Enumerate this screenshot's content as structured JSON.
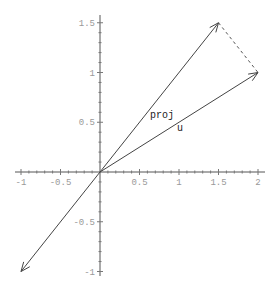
{
  "chart_data": {
    "type": "line",
    "title": "",
    "xlabel": "",
    "ylabel": "",
    "xlim": [
      -1,
      2
    ],
    "ylim": [
      -1,
      1.5
    ],
    "grid": false,
    "legend": null,
    "x_ticks": [
      {
        "value": -1,
        "label": "-1"
      },
      {
        "value": -0.5,
        "label": "-0.5"
      },
      {
        "value": 0.5,
        "label": "0.5"
      },
      {
        "value": 1,
        "label": "1"
      },
      {
        "value": 1.5,
        "label": "1.5"
      },
      {
        "value": 2,
        "label": "2"
      }
    ],
    "y_ticks": [
      {
        "value": 1.5,
        "label": "1.5"
      },
      {
        "value": 1,
        "label": "1"
      },
      {
        "value": 0.5,
        "label": "0.5"
      },
      {
        "value": -0.5,
        "label": "-0.5"
      },
      {
        "value": -1,
        "label": "-1"
      }
    ],
    "vectors": [
      {
        "name": "proj",
        "from": [
          0,
          0
        ],
        "to": [
          1.5,
          1.5
        ],
        "label": "proj",
        "label_at": [
          0.62,
          0.54
        ]
      },
      {
        "name": "u",
        "from": [
          0,
          0
        ],
        "to": [
          2,
          1
        ],
        "label": "u",
        "label_at": [
          1.0,
          0.42
        ]
      },
      {
        "name": "negative",
        "from": [
          0,
          0
        ],
        "to": [
          -1,
          -1
        ],
        "label": ""
      }
    ],
    "dashed_segments": [
      {
        "from": [
          1.5,
          1.5
        ],
        "to": [
          2,
          1
        ]
      }
    ]
  },
  "labels": {
    "proj": "proj",
    "u": "u"
  }
}
